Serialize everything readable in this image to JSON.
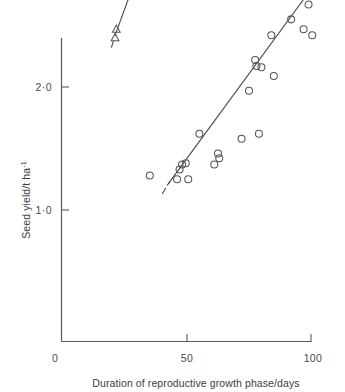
{
  "chart_data": {
    "type": "scatter",
    "title": "",
    "xlabel": "Duration of reproductive growth phase/days",
    "ylabel": "Seed yield/t ha",
    "ylabel_exponent": "-1",
    "xlim": [
      0,
      105
    ],
    "ylim": [
      0,
      2.45
    ],
    "xticks": [
      0,
      50,
      100
    ],
    "xtick_labels": [
      "0",
      "50",
      "100"
    ],
    "yticks": [
      1.0,
      2.0
    ],
    "ytick_labels": [
      "1·0",
      "2·0"
    ],
    "grid": false,
    "legend": "none",
    "series": [
      {
        "name": "circles",
        "marker": "open-circle",
        "points": [
          {
            "x": 35,
            "y": 0.28
          },
          {
            "x": 46,
            "y": 0.25
          },
          {
            "x": 47,
            "y": 0.33
          },
          {
            "x": 48,
            "y": 0.37
          },
          {
            "x": 49.5,
            "y": 0.38
          },
          {
            "x": 50.5,
            "y": 0.25
          },
          {
            "x": 55,
            "y": 0.62
          },
          {
            "x": 61,
            "y": 0.37
          },
          {
            "x": 62.5,
            "y": 0.46
          },
          {
            "x": 63,
            "y": 0.42
          },
          {
            "x": 72,
            "y": 0.58
          },
          {
            "x": 75,
            "y": 0.97
          },
          {
            "x": 77.5,
            "y": 1.22
          },
          {
            "x": 78,
            "y": 1.17
          },
          {
            "x": 79,
            "y": 0.62
          },
          {
            "x": 80,
            "y": 1.16
          },
          {
            "x": 84,
            "y": 1.42
          },
          {
            "x": 85,
            "y": 1.09
          },
          {
            "x": 92,
            "y": 1.55
          },
          {
            "x": 97,
            "y": 1.47
          },
          {
            "x": 99,
            "y": 1.67
          },
          {
            "x": 100.5,
            "y": 1.42
          }
        ]
      },
      {
        "name": "triangles",
        "marker": "open-triangle",
        "points": [
          {
            "x": 21.5,
            "y": 1.47
          },
          {
            "x": 21,
            "y": 1.4
          },
          {
            "x": 37,
            "y": 2.32
          }
        ]
      }
    ],
    "fit_lines": [
      {
        "name": "circles-regression",
        "x_start": 42,
        "y_start": 0.2,
        "x_end": 102,
        "y_end": 1.85,
        "dash_start": {
          "x_start": 40,
          "y_start": 0.13,
          "x_end": 43,
          "y_end": 0.23
        },
        "dash_end": null
      },
      {
        "name": "triangles-regression",
        "x_start": 21,
        "y_start": 1.42,
        "x_end": 38,
        "y_end": 2.36,
        "dash_start": {
          "x_start": 19.5,
          "y_start": 1.32,
          "x_end": 21.2,
          "y_end": 1.43
        },
        "dash_end": {
          "x_start": 37.8,
          "y_start": 2.35,
          "x_end": 39.5,
          "y_end": 2.46
        }
      }
    ]
  },
  "axes": {
    "x_title": "Duration of reproductive growth phase/days",
    "y_title": "Seed yield/t ha",
    "y_title_exponent": "-1",
    "x_tick_0": "0",
    "x_tick_50": "50",
    "x_tick_100": "100",
    "y_tick_1": "1·0",
    "y_tick_2": "2·0"
  }
}
